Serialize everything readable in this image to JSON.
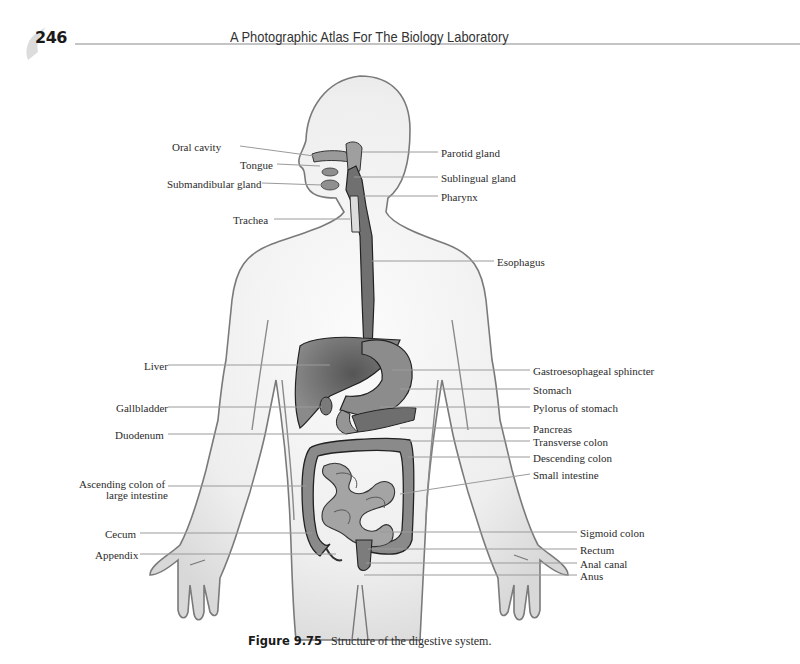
{
  "header": {
    "page_number": "246",
    "running_title": "A Photographic Atlas For The Biology Laboratory"
  },
  "figure": {
    "labels_left": [
      {
        "id": "oral-cavity",
        "text": "Oral cavity",
        "x": 172,
        "y": 141
      },
      {
        "id": "tongue",
        "text": "Tongue",
        "x": 240,
        "y": 159
      },
      {
        "id": "submandibular-gland",
        "text": "Submandibular gland",
        "x": 167,
        "y": 178
      },
      {
        "id": "trachea",
        "text": "Trachea",
        "x": 233,
        "y": 214
      },
      {
        "id": "liver",
        "text": "Liver",
        "x": 144,
        "y": 360
      },
      {
        "id": "gallbladder",
        "text": "Gallbladder",
        "x": 116,
        "y": 402
      },
      {
        "id": "duodenum",
        "text": "Duodenum",
        "x": 115,
        "y": 429
      },
      {
        "id": "ascending-colon",
        "text": "Ascending colon of",
        "x": 79,
        "y": 478
      },
      {
        "id": "ascending-colon-2",
        "text": "large intestine",
        "x": 106,
        "y": 489
      },
      {
        "id": "cecum",
        "text": "Cecum",
        "x": 105,
        "y": 528
      },
      {
        "id": "appendix",
        "text": "Appendix",
        "x": 95,
        "y": 549
      }
    ],
    "labels_right": [
      {
        "id": "parotid-gland",
        "text": "Parotid gland",
        "x": 441,
        "y": 147
      },
      {
        "id": "sublingual-gland",
        "text": "Sublingual gland",
        "x": 441,
        "y": 172
      },
      {
        "id": "pharynx",
        "text": "Pharynx",
        "x": 441,
        "y": 191
      },
      {
        "id": "esophagus",
        "text": "Esophagus",
        "x": 497,
        "y": 256
      },
      {
        "id": "gastroesophageal-sphincter",
        "text": "Gastroesophageal sphincter",
        "x": 533,
        "y": 365
      },
      {
        "id": "stomach",
        "text": "Stomach",
        "x": 533,
        "y": 384
      },
      {
        "id": "pylorus-of-stomach",
        "text": "Pylorus of stomach",
        "x": 533,
        "y": 402
      },
      {
        "id": "pancreas",
        "text": "Pancreas",
        "x": 533,
        "y": 423
      },
      {
        "id": "transverse-colon",
        "text": "Transverse colon",
        "x": 533,
        "y": 436
      },
      {
        "id": "descending-colon",
        "text": "Descending colon",
        "x": 533,
        "y": 452
      },
      {
        "id": "small-intestine",
        "text": "Small intestine",
        "x": 533,
        "y": 469
      },
      {
        "id": "sigmoid-colon",
        "text": "Sigmoid colon",
        "x": 580,
        "y": 527
      },
      {
        "id": "rectum",
        "text": "Rectum",
        "x": 580,
        "y": 544
      },
      {
        "id": "anal-canal",
        "text": "Anal canal",
        "x": 580,
        "y": 558
      },
      {
        "id": "anus",
        "text": "Anus",
        "x": 580,
        "y": 570
      }
    ],
    "colors": {
      "body_fill": "#ececec",
      "body_outline": "#7a7a7a",
      "organ_dark": "#6a6a6a",
      "organ_mid": "#8f8f8f",
      "organ_light": "#a8a8a8",
      "leader_line": "#9a9a9a"
    }
  },
  "caption": {
    "figure_number": "Figure 9.75",
    "text": "Structure of the digestive system."
  }
}
